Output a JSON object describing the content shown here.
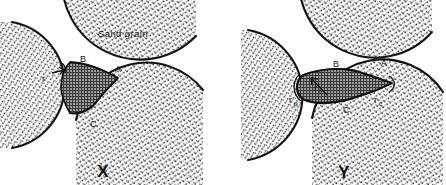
{
  "figure": {
    "title_text": "Sand grain",
    "panels": [
      {
        "id": "X",
        "caption": "X",
        "labels": {
          "sand_grain": "Sand grain",
          "contact_a": "A",
          "contact_b": "B",
          "contact_c": "C",
          "radius_r": "r"
        }
      },
      {
        "id": "Y",
        "caption": "Y",
        "labels": {
          "contact_a": "A",
          "contact_b": "B",
          "contact_c": "C",
          "radius_p_base": "r",
          "radius_p_sub": "p",
          "radius_c_base": "r",
          "radius_c_sub": "c",
          "radius_t_base": "r",
          "radius_t_sub": "t"
        }
      }
    ],
    "colors": {
      "ink": "#111111",
      "background": "#ffffff",
      "grain_stipple": "#2a2a2a",
      "bridge_fill": "#9a9a9a",
      "bridge_hatch": "#3a3a3a"
    }
  }
}
